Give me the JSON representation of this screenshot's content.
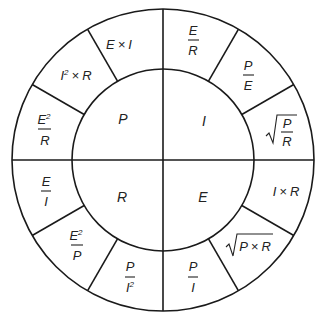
{
  "diagram": {
    "title": "",
    "type": "ohms-law-wheel",
    "colors": {
      "line": "#1a1a1a",
      "text": "#222222",
      "background": "#ffffff"
    },
    "quadrants": [
      {
        "id": "power",
        "symbol": "P"
      },
      {
        "id": "current",
        "symbol": "I"
      },
      {
        "id": "resistance",
        "symbol": "R"
      },
      {
        "id": "voltage",
        "symbol": "E"
      }
    ],
    "formulas": {
      "power": [
        {
          "id": "e-times-i",
          "text": "E × I",
          "a": "E",
          "op": "×",
          "b": "I"
        },
        {
          "id": "i2-times-r",
          "text": "I² × R",
          "a": "I",
          "a_sup": "2",
          "op": "×",
          "b": "R"
        },
        {
          "id": "e2-over-r",
          "text": "E²/R",
          "num": "E",
          "num_sup": "2",
          "den": "R"
        }
      ],
      "current": [
        {
          "id": "e-over-r",
          "text": "E/R",
          "num": "E",
          "den": "R"
        },
        {
          "id": "p-over-e",
          "text": "P/E",
          "num": "P",
          "den": "E"
        },
        {
          "id": "sqrt-p-over-r",
          "text": "√(P/R)",
          "num": "P",
          "den": "R"
        }
      ],
      "resistance": [
        {
          "id": "e-over-i",
          "text": "E/I",
          "num": "E",
          "den": "I"
        },
        {
          "id": "e2-over-p",
          "text": "E²/P",
          "num": "E",
          "num_sup": "2",
          "den": "P"
        },
        {
          "id": "p-over-i2",
          "text": "P/I²",
          "num": "P",
          "den": "I",
          "den_sup": "2"
        }
      ],
      "voltage": [
        {
          "id": "p-over-i",
          "text": "P/I",
          "num": "P",
          "den": "I"
        },
        {
          "id": "sqrt-p-times-r",
          "text": "√(P × R)",
          "a": "P",
          "op": "×",
          "b": "R"
        },
        {
          "id": "i-times-r",
          "text": "I × R",
          "a": "I",
          "op": "×",
          "b": "R"
        }
      ]
    }
  }
}
